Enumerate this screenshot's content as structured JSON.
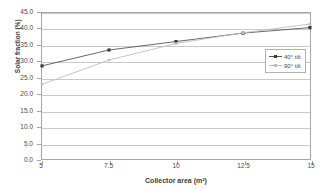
{
  "chart_data": {
    "type": "line",
    "title": "",
    "xlabel": "Collector area (m²)",
    "ylabel": "Solar fraction (%)",
    "x": [
      5,
      7.5,
      10,
      12.5,
      15
    ],
    "xlim": [
      5,
      15
    ],
    "ylim": [
      0.0,
      45.0
    ],
    "grid": true,
    "legend_position": "right",
    "x_tick_labels": [
      "5",
      "7.5",
      "10",
      "12.5",
      "15"
    ],
    "y_tick_labels": [
      "0.0",
      "5.0",
      "10.0",
      "15.0",
      "20.0",
      "25.0",
      "30.0",
      "35.0",
      "40.0",
      "45.0"
    ],
    "y_ticks": [
      0.0,
      5.0,
      10.0,
      15.0,
      20.0,
      25.0,
      30.0,
      35.0,
      40.0,
      45.0
    ],
    "series": [
      {
        "name": "40° tilt",
        "marker": "filled-square",
        "color": "#555555",
        "values": [
          28.7,
          33.6,
          36.2,
          38.8,
          40.5
        ]
      },
      {
        "name": "90° tilt",
        "marker": "light-square",
        "color": "#bdbdbd",
        "values": [
          23.0,
          30.5,
          35.6,
          38.9,
          41.6
        ]
      }
    ]
  },
  "legend": {
    "entries": [
      {
        "label": "40° tilt"
      },
      {
        "label": "90° tilt"
      }
    ]
  },
  "colors": {
    "series_40": "#555555",
    "series_90": "#bdbdbd",
    "gridline": "#c9c9c9",
    "axis": "#a6a6a6",
    "text": "#4a4a4a",
    "background": "#ffffff"
  }
}
